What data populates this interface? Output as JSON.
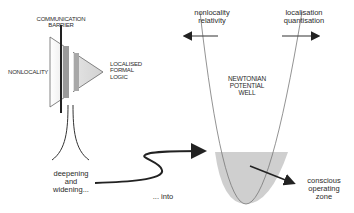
{
  "left_diagram": {
    "barrier_label_line1": "COMMUNICATION",
    "barrier_label_line2": "BARRIER",
    "nonlocality_label": "NONLOCALITY",
    "localised_line1": "LOCALISED",
    "localised_line2": "FORMAL",
    "localised_line3": "LOGIC",
    "deepening_line1": "deepening",
    "deepening_line2": "and",
    "deepening_line3": "widening...",
    "into_label": "... into"
  },
  "right_diagram": {
    "left_arrow_line1": "nonlocality",
    "left_arrow_line2": "relativity",
    "right_arrow_line1": "localisation",
    "right_arrow_line2": "quantisation",
    "well_line1": "NEWTONIAN",
    "well_line2": "POTENTIAL",
    "well_line3": "WELL",
    "zone_line1": "conscious",
    "zone_line2": "operating",
    "zone_line3": "zone"
  },
  "colors": {
    "fill_gray": "#cfcfcf",
    "band_dark": "#9a9a9a",
    "line": "#222222"
  }
}
